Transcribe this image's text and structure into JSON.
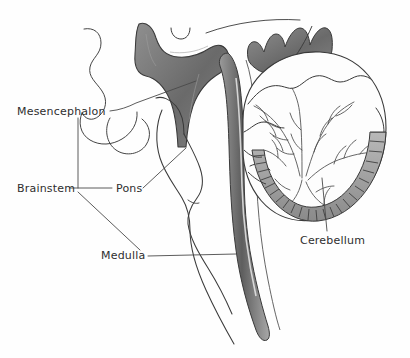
{
  "figure": {
    "type": "anatomical-line-drawing",
    "background_color": "#fefefe",
    "ink_color": "#3a3a3a",
    "text_color": "#2e2e2e",
    "shade_color": "#6e6e6e"
  },
  "labels": {
    "mesencephalon": "Mesencephalon",
    "brainstem": "Brainstem",
    "pons": "Pons",
    "medulla": "Medulla",
    "cerebellum": "Cerebellum"
  },
  "structures": [
    {
      "name": "mesencephalon",
      "label": "Mesencephalon",
      "region": "midbrain"
    },
    {
      "name": "pons",
      "label": "Pons",
      "region": "brainstem"
    },
    {
      "name": "medulla",
      "label": "Medulla",
      "region": "brainstem"
    },
    {
      "name": "brainstem",
      "label": "Brainstem",
      "region": "bracket-group"
    },
    {
      "name": "cerebellum",
      "label": "Cerebellum",
      "region": "hindbrain"
    }
  ],
  "bracket": {
    "groups": [
      "Mesencephalon",
      "Pons",
      "Medulla"
    ],
    "group_label": "Brainstem"
  }
}
